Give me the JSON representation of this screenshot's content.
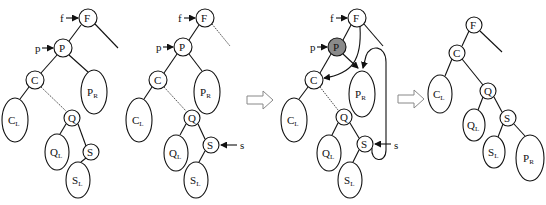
{
  "figure": {
    "panels": [
      {
        "id": "stage-1",
        "pointers": [
          {
            "label": "f",
            "target": "F"
          },
          {
            "label": "p",
            "target": "P"
          }
        ],
        "nodes": [
          {
            "id": "F",
            "label": "F",
            "x": 88,
            "y": 18,
            "r": 9
          },
          {
            "id": "P",
            "label": "P",
            "x": 63,
            "y": 48,
            "r": 9
          },
          {
            "id": "C",
            "label": "C",
            "x": 35,
            "y": 80,
            "r": 9
          },
          {
            "id": "Q",
            "label": "Q",
            "x": 72,
            "y": 118,
            "r": 8
          },
          {
            "id": "S",
            "label": "S",
            "x": 91,
            "y": 152,
            "r": 8
          }
        ],
        "subtrees": [
          {
            "id": "PR",
            "label": "P",
            "sub": "R",
            "x": 94,
            "y": 92,
            "rx": 13,
            "ry": 22
          },
          {
            "id": "CL",
            "label": "C",
            "sub": "L",
            "x": 15,
            "y": 120,
            "rx": 13,
            "ry": 22
          },
          {
            "id": "QL",
            "label": "Q",
            "sub": "L",
            "x": 57,
            "y": 152,
            "rx": 12,
            "ry": 18
          },
          {
            "id": "SL",
            "label": "S",
            "sub": "L",
            "x": 78,
            "y": 180,
            "rx": 12,
            "ry": 18
          }
        ]
      },
      {
        "id": "stage-2",
        "pointers": [
          {
            "label": "f",
            "target": "F"
          },
          {
            "label": "p",
            "target": "P"
          },
          {
            "label": "s",
            "target": "S"
          }
        ],
        "nodes": [
          {
            "id": "F",
            "label": "F",
            "x": 205,
            "y": 18,
            "r": 9
          },
          {
            "id": "P",
            "label": "P",
            "x": 183,
            "y": 47,
            "r": 9
          },
          {
            "id": "C",
            "label": "C",
            "x": 158,
            "y": 80,
            "r": 9
          },
          {
            "id": "Q",
            "label": "Q",
            "x": 192,
            "y": 118,
            "r": 8
          },
          {
            "id": "S",
            "label": "S",
            "x": 211,
            "y": 145,
            "r": 8
          }
        ],
        "subtrees": [
          {
            "id": "PR",
            "label": "P",
            "sub": "R",
            "x": 207,
            "y": 92,
            "rx": 13,
            "ry": 22
          },
          {
            "id": "CL",
            "label": "C",
            "sub": "L",
            "x": 139,
            "y": 120,
            "rx": 13,
            "ry": 22
          },
          {
            "id": "QL",
            "label": "Q",
            "sub": "L",
            "x": 176,
            "y": 153,
            "rx": 12,
            "ry": 18
          },
          {
            "id": "SL",
            "label": "S",
            "sub": "L",
            "x": 196,
            "y": 180,
            "rx": 12,
            "ry": 18
          }
        ]
      },
      {
        "id": "stage-3",
        "pointers": [
          {
            "label": "f",
            "target": "F"
          },
          {
            "label": "p",
            "target": "P"
          },
          {
            "label": "s",
            "target": "S"
          }
        ],
        "highlighted": "P",
        "nodes": [
          {
            "id": "F",
            "label": "F",
            "x": 357,
            "y": 18,
            "r": 9
          },
          {
            "id": "P",
            "label": "P",
            "x": 337,
            "y": 47,
            "r": 9
          },
          {
            "id": "C",
            "label": "C",
            "x": 314,
            "y": 80,
            "r": 9
          },
          {
            "id": "Q",
            "label": "Q",
            "x": 344,
            "y": 117,
            "r": 8
          },
          {
            "id": "S",
            "label": "S",
            "x": 365,
            "y": 144,
            "r": 8
          }
        ],
        "subtrees": [
          {
            "id": "PR",
            "label": "P",
            "sub": "R",
            "x": 362,
            "y": 92,
            "rx": 13,
            "ry": 23
          },
          {
            "id": "CL",
            "label": "C",
            "sub": "L",
            "x": 294,
            "y": 120,
            "rx": 13,
            "ry": 22
          },
          {
            "id": "QL",
            "label": "Q",
            "sub": "L",
            "x": 329,
            "y": 153,
            "rx": 12,
            "ry": 18
          },
          {
            "id": "SL",
            "label": "S",
            "sub": "L",
            "x": 350,
            "y": 180,
            "rx": 12,
            "ry": 18
          }
        ]
      },
      {
        "id": "stage-4",
        "pointers": [],
        "nodes": [
          {
            "id": "F",
            "label": "F",
            "x": 474,
            "y": 25,
            "r": 8
          },
          {
            "id": "C",
            "label": "C",
            "x": 457,
            "y": 53,
            "r": 8
          },
          {
            "id": "Q",
            "label": "Q",
            "x": 488,
            "y": 91,
            "r": 8
          },
          {
            "id": "S",
            "label": "S",
            "x": 508,
            "y": 118,
            "r": 8
          }
        ],
        "subtrees": [
          {
            "id": "CL",
            "label": "C",
            "sub": "L",
            "x": 440,
            "y": 94,
            "rx": 12,
            "ry": 19
          },
          {
            "id": "QL",
            "label": "Q",
            "sub": "L",
            "x": 474,
            "y": 125,
            "rx": 11,
            "ry": 16
          },
          {
            "id": "SL",
            "label": "S",
            "sub": "L",
            "x": 494,
            "y": 152,
            "rx": 11,
            "ry": 16
          },
          {
            "id": "PR",
            "label": "P",
            "sub": "R",
            "x": 530,
            "y": 158,
            "rx": 14,
            "ry": 23
          }
        ]
      }
    ],
    "transition_arrows": [
      {
        "from": "stage-2",
        "to": "stage-3"
      },
      {
        "from": "stage-3",
        "to": "stage-4"
      }
    ],
    "colors": {
      "highlight_node": "#8a8a8a",
      "line": "#111111",
      "transition_arrow": "#888888"
    }
  },
  "labels": {
    "F": "F",
    "P": "P",
    "C": "C",
    "Q": "Q",
    "S": "S",
    "f": "f",
    "p": "p",
    "s": "s",
    "R": "R",
    "L": "L"
  }
}
